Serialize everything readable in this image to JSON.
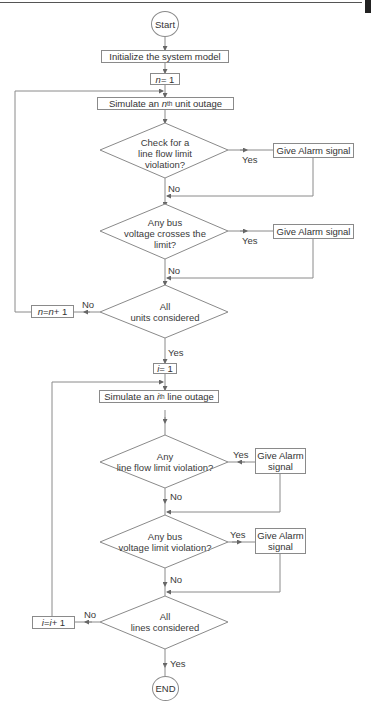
{
  "flowchart": {
    "start": "Start",
    "end": "END",
    "unit_section": {
      "init": "Initialize the system model",
      "n_init_var": "n",
      "n_init_rest": " = 1",
      "simulate_prefix": "Simulate an ",
      "simulate_var": "n",
      "simulate_sup": "th",
      "simulate_suffix": " unit outage",
      "decision1": [
        "Check for a",
        "line flow limit",
        "violation?"
      ],
      "decision2": [
        "Any bus",
        "voltage crosses the",
        "limit?"
      ],
      "decision3": [
        "All",
        "units considered"
      ],
      "alarm1": "Give Alarm signal",
      "alarm2": "Give Alarm signal",
      "increment_a": "n",
      "increment_b": " = ",
      "increment_c": "n",
      "increment_d": " + 1"
    },
    "line_section": {
      "i_init_var": "i",
      "i_init_rest": " = 1",
      "simulate_prefix": "Simulate an ",
      "simulate_var": "i",
      "simulate_sup": "th",
      "simulate_suffix": " line outage",
      "decision1": [
        "Any",
        "line flow limit violation?"
      ],
      "decision2": [
        "Any bus",
        "voltage limit violation?"
      ],
      "decision3": [
        "All",
        "lines considered"
      ],
      "alarm1": [
        "Give Alarm",
        "signal"
      ],
      "alarm2": [
        "Give Alarm",
        "signal"
      ],
      "increment_a": "i",
      "increment_b": " = ",
      "increment_c": "i",
      "increment_d": " + 1"
    },
    "labels": {
      "yes": "Yes",
      "no": "No"
    },
    "colors": {
      "line": "#8a8a8a",
      "text": "#333333"
    }
  }
}
